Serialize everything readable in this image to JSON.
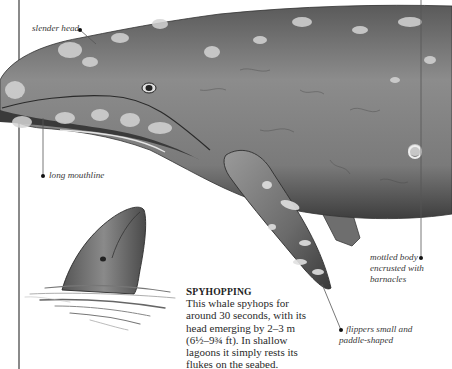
{
  "annotations": {
    "slender_head": "slender head",
    "long_mouthline": "long mouthline",
    "mottled_body": [
      "mottled body",
      "encrusted with",
      "barnacles"
    ],
    "flippers": [
      "flippers small and",
      "paddle-shaped"
    ]
  },
  "sidebar_box": {
    "title_initial": "S",
    "title_rest": "PYHOPPING",
    "body": [
      "This whale spyhops for",
      "around 30 seconds, with its",
      "head emerging by 2–3 m",
      "(6½–9¾ ft). In shallow",
      "lagoons it simply rests its",
      "flukes on the seabed."
    ]
  },
  "colors": {
    "whale_dark": "#4a4a4a",
    "whale_mid": "#7d7d7d",
    "whale_light": "#b8b8b8",
    "barnacle": "#d8d8d8",
    "rule": "#8a8a8a"
  }
}
